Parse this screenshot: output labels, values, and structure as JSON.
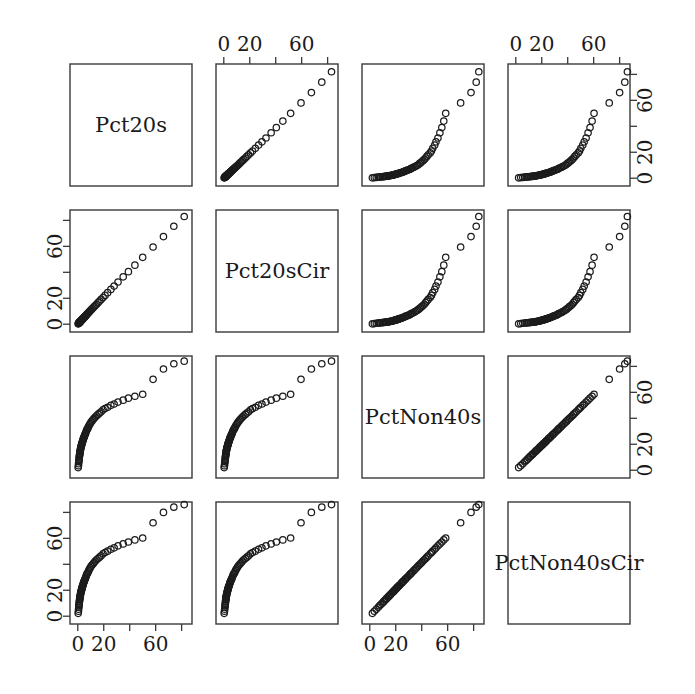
{
  "figure": {
    "type": "scatterplot-matrix",
    "variables": [
      "Pct20s",
      "Pct20sCir",
      "PctNon40s",
      "PctNon40sCir"
    ],
    "background_color": "#ffffff",
    "marker_color": "#1c1c1c",
    "axis_color": "#3a3a3a"
  },
  "axis": {
    "tick_values": [
      0,
      20,
      40,
      60,
      80
    ],
    "tick_labels": [
      "0",
      "20",
      "",
      "60",
      ""
    ],
    "range": [
      -6,
      88
    ]
  },
  "chart_data": {
    "type": "scatter",
    "title": "",
    "xlabel": "",
    "ylabel": "",
    "grid": false,
    "legend": "none",
    "matrix": "4x4 scatterplot matrix (pairs plot); diagonal cells show variable names",
    "variables": [
      "Pct20s",
      "Pct20sCir",
      "PctNon40s",
      "PctNon40sCir"
    ],
    "axis_ticks": [
      0,
      20,
      40,
      60,
      80
    ],
    "axis_tick_labels": [
      "0",
      "20",
      "",
      "60",
      ""
    ],
    "xlim": [
      -6,
      88
    ],
    "ylim": [
      -6,
      88
    ],
    "columns": {
      "Pct20s": [
        0.3,
        0.5,
        0.6,
        0.8,
        0.9,
        1.0,
        1.1,
        1.2,
        1.3,
        1.4,
        1.5,
        1.6,
        1.7,
        1.8,
        1.9,
        2.0,
        2.1,
        2.2,
        2.4,
        2.5,
        2.6,
        2.8,
        2.9,
        3.0,
        3.2,
        3.3,
        3.5,
        3.6,
        3.8,
        4.0,
        4.2,
        4.4,
        4.6,
        4.8,
        5.0,
        5.3,
        5.6,
        5.9,
        6.2,
        6.5,
        6.9,
        7.2,
        7.6,
        8.0,
        8.5,
        9.0,
        9.6,
        10.2,
        11.0,
        11.8,
        12.6,
        13.5,
        14.5,
        15.6,
        16.8,
        18.0,
        19.5,
        21.0,
        23.0,
        25.5,
        28.0,
        31.0,
        35.0,
        39.0,
        44.0,
        50.0,
        58.0,
        66.0,
        74.0,
        82.0
      ],
      "Pct20sCir": [
        0.3,
        0.5,
        0.7,
        0.9,
        1.0,
        1.1,
        1.2,
        1.3,
        1.4,
        1.5,
        1.6,
        1.7,
        1.8,
        1.9,
        2.0,
        2.1,
        2.2,
        2.4,
        2.5,
        2.7,
        2.8,
        3.0,
        3.1,
        3.2,
        3.4,
        3.5,
        3.7,
        3.9,
        4.1,
        4.3,
        4.5,
        4.7,
        4.9,
        5.1,
        5.4,
        5.7,
        6.0,
        6.3,
        6.6,
        7.0,
        7.4,
        7.8,
        8.2,
        8.6,
        9.1,
        9.7,
        10.3,
        11.0,
        11.8,
        12.6,
        13.5,
        14.4,
        15.4,
        16.6,
        17.8,
        19.1,
        20.6,
        22.2,
        24.3,
        26.8,
        29.4,
        32.5,
        36.5,
        40.5,
        45.5,
        51.5,
        59.5,
        67.5,
        75.5,
        83.0
      ],
      "PctNon40s": [
        2.0,
        3.5,
        5.0,
        6.5,
        7.5,
        8.5,
        9.5,
        10.5,
        11.0,
        12.0,
        12.5,
        13.0,
        14.0,
        14.5,
        15.0,
        15.5,
        16.0,
        17.0,
        17.5,
        18.0,
        18.5,
        19.0,
        19.5,
        20.0,
        20.5,
        21.0,
        21.5,
        22.0,
        22.5,
        23.0,
        24.0,
        24.5,
        25.0,
        25.5,
        26.0,
        27.0,
        27.5,
        28.0,
        29.0,
        30.0,
        31.0,
        31.5,
        32.0,
        33.0,
        34.0,
        35.0,
        36.0,
        37.0,
        38.0,
        39.0,
        40.0,
        41.0,
        42.0,
        43.0,
        44.0,
        45.0,
        46.5,
        47.5,
        48.5,
        50.0,
        51.0,
        52.5,
        54.0,
        55.5,
        57.0,
        58.5,
        70.0,
        78.0,
        82.0,
        84.0
      ],
      "PctNon40sCir": [
        2.2,
        3.8,
        5.4,
        6.9,
        8.0,
        9.0,
        10.0,
        11.0,
        11.6,
        12.6,
        13.1,
        13.7,
        14.7,
        15.2,
        15.7,
        16.2,
        16.8,
        17.8,
        18.3,
        18.8,
        19.3,
        19.9,
        20.4,
        20.9,
        21.4,
        22.0,
        22.5,
        23.0,
        23.5,
        24.0,
        25.0,
        25.5,
        26.1,
        26.6,
        27.1,
        28.1,
        28.6,
        29.2,
        30.2,
        31.2,
        32.2,
        32.7,
        33.2,
        34.3,
        35.3,
        36.3,
        37.3,
        38.4,
        39.4,
        40.4,
        41.4,
        42.5,
        43.5,
        44.5,
        45.5,
        46.6,
        48.1,
        49.1,
        50.1,
        51.6,
        52.7,
        54.2,
        55.7,
        57.2,
        58.8,
        60.3,
        72.0,
        80.0,
        84.0,
        86.0
      ]
    },
    "pair_descriptions": {
      "Pct20s_vs_Pct20sCir": "near-perfect positive linear relationship, dense cluster near origin",
      "Pct20s_vs_PctNon40s": "positive curved relationship with heavy cluster at low values",
      "Pct20s_vs_PctNon40sCir": "positive curved relationship with heavy cluster at low values",
      "Pct20sCir_vs_PctNon40s": "positive curved relationship with heavy cluster at low values",
      "Pct20sCir_vs_PctNon40sCir": "positive curved relationship with heavy cluster at low values",
      "PctNon40s_vs_PctNon40sCir": "near-perfect positive linear relationship along the diagonal"
    }
  }
}
